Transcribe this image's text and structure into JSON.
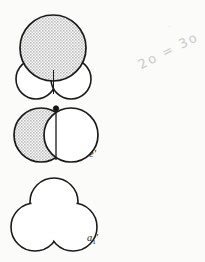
{
  "page": {
    "background_color": "#fbfbfa",
    "width": 205,
    "height": 262
  },
  "style": {
    "shaded_fill": "#d2d2d2",
    "unshaded_fill": "#ffffff",
    "outline_color": "#1a1a1a",
    "outline_width": 1.6,
    "divider_width": 1.0,
    "dot_color": "#151515",
    "annotation_color": "#c9c9c9"
  },
  "figures": [
    {
      "id": "figure-top",
      "name": "molecular-orbital-top",
      "label": "",
      "description": "one large shaded lobe above two small unshaded lobes",
      "lobes": [
        {
          "name": "large-upper-lobe",
          "shaded": true,
          "cx": 53,
          "cy": 48,
          "r": 33
        },
        {
          "name": "small-lower-left-lobe",
          "shaded": false,
          "cx": 36,
          "cy": 79,
          "r": 20
        },
        {
          "name": "small-lower-right-lobe",
          "shaded": false,
          "cx": 71,
          "cy": 79,
          "r": 20
        }
      ]
    },
    {
      "id": "figure-middle",
      "name": "molecular-orbital-e-prime",
      "label": "e′",
      "description": "two equal lobes side by side, left shaded, right unshaded, with a node dot at the top junction",
      "lobes": [
        {
          "name": "left-lobe",
          "shaded": true,
          "cx": 41,
          "cy": 135,
          "r": 27
        },
        {
          "name": "right-lobe",
          "shaded": false,
          "cx": 71,
          "cy": 135,
          "r": 27
        }
      ],
      "node_marker": {
        "name": "node-dot",
        "cx": 56,
        "cy": 109,
        "r": 2.6
      }
    },
    {
      "id": "figure-bottom",
      "name": "molecular-orbital-a1-prime",
      "label_base": "a",
      "label_sub": "1",
      "label_prime": "′",
      "label": "a1′",
      "description": "three-lobed clover outline, entirely unshaded",
      "lobes": [
        {
          "name": "top-lobe",
          "shaded": false,
          "cx": 54,
          "cy": 202,
          "r": 24
        },
        {
          "name": "bottom-left-lobe",
          "shaded": false,
          "cx": 35,
          "cy": 227,
          "r": 24
        },
        {
          "name": "bottom-right-lobe",
          "shaded": false,
          "cx": 73,
          "cy": 227,
          "r": 24
        }
      ]
    }
  ],
  "annotations": {
    "handwritten_note": "2o = 3o",
    "handwritten_dot": "·"
  }
}
